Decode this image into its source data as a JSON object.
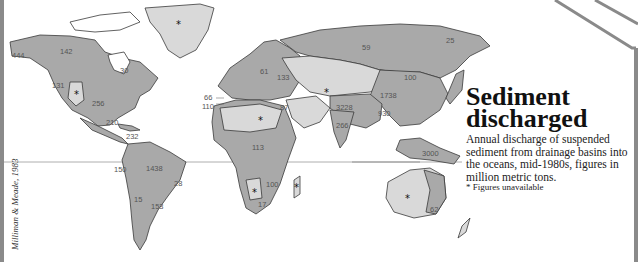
{
  "title": "Sediment discharged",
  "title_line1": "Sediment",
  "title_line2": "discharged",
  "description": "Annual discharge of suspended sediment from drainage basins into the oceans, mid-1980s, figures in million metric tons.",
  "legend_note": "* Figures unavailable",
  "credit": "Milliman & Meade, 1983",
  "colors": {
    "land_dark": "#a9a9a9",
    "land_light": "#d9d9d9",
    "border": "#3a3a3a",
    "equator": "#9a9a9a",
    "frame": "#8a8a8a"
  },
  "labels": [
    {
      "region": "Alaska / Yukon",
      "value": "444"
    },
    {
      "region": "Mackenzie basin",
      "value": "142"
    },
    {
      "region": "Hudson Bay / St. Lawrence",
      "value": "30"
    },
    {
      "region": "Columbia basin",
      "value": "131"
    },
    {
      "region": "Mississippi basin",
      "value": "256"
    },
    {
      "region": "Central America / Mexico",
      "value": "210"
    },
    {
      "region": "Orinoco / Caribbean",
      "value": "232"
    },
    {
      "region": "Pacific South America",
      "value": "150"
    },
    {
      "region": "Amazon basin",
      "value": "1438"
    },
    {
      "region": "Eastern Brazil",
      "value": "28"
    },
    {
      "region": "Andean west",
      "value": "15"
    },
    {
      "region": "Parana basin",
      "value": "153"
    },
    {
      "region": "Mediterranean (west)",
      "value": "66"
    },
    {
      "region": "Atlantic Iberia",
      "value": "110"
    },
    {
      "region": "Northern Europe",
      "value": "61"
    },
    {
      "region": "Black Sea basin",
      "value": "133"
    },
    {
      "region": "Siberia",
      "value": "59"
    },
    {
      "region": "Eastern Siberia",
      "value": "25"
    },
    {
      "region": "Amur basin",
      "value": "100"
    },
    {
      "region": "Yellow River basin",
      "value": "1738"
    },
    {
      "region": "Middle East",
      "value": "87"
    },
    {
      "region": "Ganges-Brahmaputra",
      "value": "3228"
    },
    {
      "region": "India",
      "value": "266"
    },
    {
      "region": "South China",
      "value": "930"
    },
    {
      "region": "Oceania islands",
      "value": "3000"
    },
    {
      "region": "Eastern Australia",
      "value": "62"
    },
    {
      "region": "West Africa",
      "value": "113"
    },
    {
      "region": "Central Africa",
      "value": "100"
    },
    {
      "region": "Southern Africa",
      "value": "17"
    }
  ],
  "unavailable_regions": [
    "Greenland",
    "Great Basin",
    "Sahara",
    "Central Asia",
    "Kalahari",
    "Madagascar",
    "Interior Australia"
  ]
}
